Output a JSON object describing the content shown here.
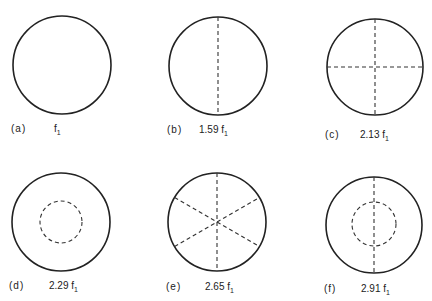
{
  "figure": {
    "panels": [
      {
        "id": "a",
        "label": "(a)",
        "freq_prefix": "f",
        "freq_sub": "1",
        "freq_value": "",
        "nodal_diameters": 0,
        "nodal_circles": 0
      },
      {
        "id": "b",
        "label": "(b)",
        "freq_value": "1.59",
        "freq_prefix": "f",
        "freq_sub": "1",
        "nodal_diameters": 1,
        "nodal_circles": 0
      },
      {
        "id": "c",
        "label": "(c)",
        "freq_value": "2.13",
        "freq_prefix": "f",
        "freq_sub": "1",
        "nodal_diameters": 2,
        "nodal_circles": 0
      },
      {
        "id": "d",
        "label": "(d)",
        "freq_value": "2.29",
        "freq_prefix": "f",
        "freq_sub": "1",
        "nodal_diameters": 0,
        "nodal_circles": 1
      },
      {
        "id": "e",
        "label": "(e)",
        "freq_value": "2.65",
        "freq_prefix": "f",
        "freq_sub": "1",
        "nodal_diameters": 3,
        "nodal_circles": 0
      },
      {
        "id": "f",
        "label": "(f)",
        "freq_value": "2.91",
        "freq_prefix": "f",
        "freq_sub": "1",
        "nodal_diameters": 1,
        "nodal_circles": 1
      }
    ]
  }
}
